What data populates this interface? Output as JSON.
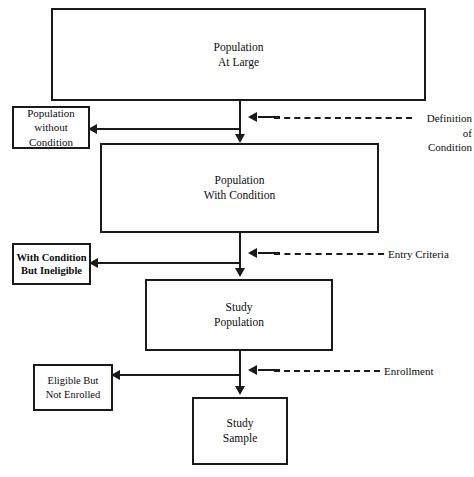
{
  "diagram": {
    "background_color": "#ffffff",
    "stroke_color": "#1a1a1a",
    "text_color": "#0d0d0d",
    "nodes": [
      {
        "id": "population-at-large",
        "lines": [
          "Population",
          "At Large"
        ],
        "line1": "Population",
        "line2": "At Large"
      },
      {
        "id": "population-without-condition",
        "lines": [
          "Population",
          "without",
          "Condition"
        ],
        "line1": "Population",
        "line2": "without",
        "line3": "Condition"
      },
      {
        "id": "population-with-condition",
        "lines": [
          "Population",
          "With Condition"
        ],
        "line1": "Population",
        "line2": "With Condition"
      },
      {
        "id": "with-condition-but-ineligible",
        "lines": [
          "With Condition",
          "But Ineligible"
        ],
        "line1": "With Condition",
        "line2": "But Ineligible"
      },
      {
        "id": "study-population",
        "lines": [
          "Study",
          "Population"
        ],
        "line1": "Study",
        "line2": "Population"
      },
      {
        "id": "eligible-but-not-enrolled",
        "lines": [
          "Eligible But",
          "Not Enrolled"
        ],
        "line1": "Eligible But",
        "line2": "Not Enrolled"
      },
      {
        "id": "study-sample",
        "lines": [
          "Study",
          "Sample"
        ],
        "line1": "Study",
        "line2": "Sample"
      }
    ],
    "annotations": [
      {
        "id": "definition-of-condition",
        "lines": [
          "Definition",
          "of",
          "Condition"
        ],
        "line1": "Definition",
        "line2": "of",
        "line3": "Condition",
        "style": "dashed-arrow-left"
      },
      {
        "id": "entry-criteria",
        "lines": [
          "Entry Criteria"
        ],
        "line1": "Entry Criteria",
        "style": "dashed-arrow-left"
      },
      {
        "id": "enrollment",
        "lines": [
          "Enrollment"
        ],
        "line1": "Enrollment",
        "style": "dashed-arrow-left"
      }
    ],
    "flow": {
      "main_path": [
        "Population At Large",
        "Population With Condition",
        "Study Population",
        "Study Sample"
      ],
      "exclusions": [
        "Population without Condition",
        "With Condition But Ineligible",
        "Eligible But Not Enrolled"
      ]
    }
  }
}
